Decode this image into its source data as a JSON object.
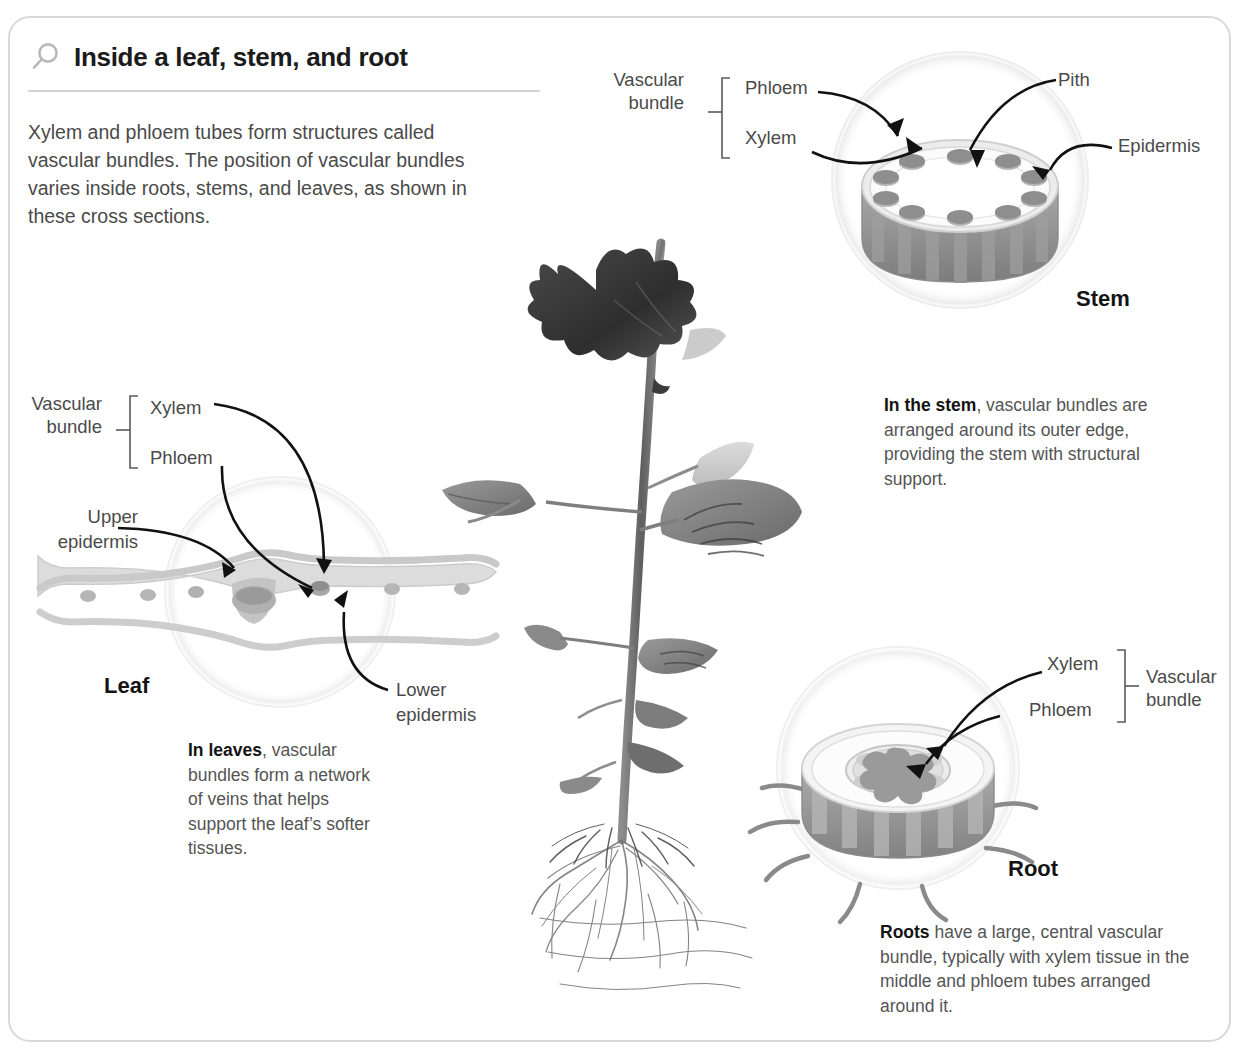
{
  "header": {
    "icon": "magnifier-icon",
    "title": "Inside a leaf, stem, and root",
    "intro": "Xylem and phloem tubes form structures called vascular bundles. The position of vascular bundles varies inside roots, stems, and leaves, as shown in these cross sections."
  },
  "stem": {
    "section_title": "Stem",
    "bracket_label_line1": "Vascular",
    "bracket_label_line2": "bundle",
    "label_phloem": "Phloem",
    "label_xylem": "Xylem",
    "label_pith": "Pith",
    "label_epidermis": "Epidermis",
    "caption_bold": "In the stem",
    "caption_rest": ", vascular bundles are arranged around its outer edge, providing the stem with structural support.",
    "bundle_count": 10
  },
  "leaf": {
    "section_title": "Leaf",
    "bracket_label_line1": "Vascular",
    "bracket_label_line2": "bundle",
    "label_xylem": "Xylem",
    "label_phloem": "Phloem",
    "label_upper_epidermis_line1": "Upper",
    "label_upper_epidermis_line2": "epidermis",
    "label_lower_epidermis_line1": "Lower",
    "label_lower_epidermis_line2": "epidermis",
    "caption_bold": "In leaves",
    "caption_rest": ", vascular bundles form a network of veins that helps support the leaf’s softer tissues."
  },
  "root": {
    "section_title": "Root",
    "bracket_label_line1": "Vascular",
    "bracket_label_line2": "bundle",
    "label_xylem": "Xylem",
    "label_phloem": "Phloem",
    "caption_bold": "Roots",
    "caption_rest": " have a large, central vascular bundle, typically with xylem tissue in the middle and phloem tubes arranged around it."
  },
  "plant_photo": {
    "alt": "grayscale photograph of a young plant with leaves, stem and exposed fibrous roots"
  },
  "colors": {
    "card_border": "#d9d9d9",
    "title_text": "#1b1b1b",
    "body_text": "#4a4a4a",
    "rule": "#d4d4d4",
    "arrow": "#111111",
    "tissue_light": "#e3e3e3",
    "tissue_mid": "#bfbfbf",
    "tissue_dark": "#8f8f8f",
    "halo": "#f2f2f2"
  }
}
